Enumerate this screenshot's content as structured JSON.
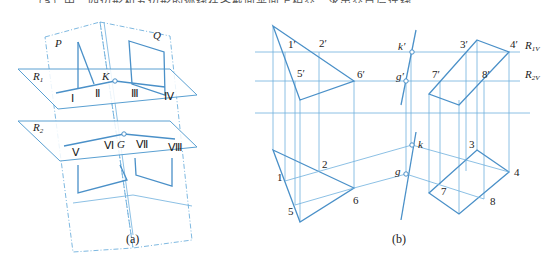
{
  "header_partial_text": "（a）中，四边形和五边形的迹线在各截面平面上相交，求出交点后连线即得交线。",
  "figure_a": {
    "caption": "(a)",
    "planes": {
      "P": "P",
      "Q": "Q",
      "R1": "R",
      "R1_sub": "1",
      "R2": "R",
      "R2_sub": "2"
    },
    "points": {
      "K": "K",
      "G": "G"
    },
    "roman": [
      "Ⅰ",
      "Ⅱ",
      "Ⅲ",
      "Ⅳ",
      "Ⅴ",
      "Ⅵ",
      "Ⅶ",
      "Ⅷ"
    ]
  },
  "figure_b": {
    "caption": "(b)",
    "front_labels": {
      "p1": "1′",
      "p2": "2′",
      "p3": "3′",
      "p4": "4′",
      "p5": "5′",
      "p6": "6′",
      "p7": "7′",
      "p8": "8′",
      "k": "k′",
      "g": "g′"
    },
    "trace_labels": {
      "R1V": "R",
      "R1V_sub": "1V",
      "R2V": "R",
      "R2V_sub": "2V"
    },
    "top_labels": {
      "p1": "1",
      "p2": "2",
      "p3": "3",
      "p4": "4",
      "p5": "5",
      "p6": "6",
      "p7": "7",
      "p8": "8",
      "k": "k",
      "g": "g"
    }
  }
}
